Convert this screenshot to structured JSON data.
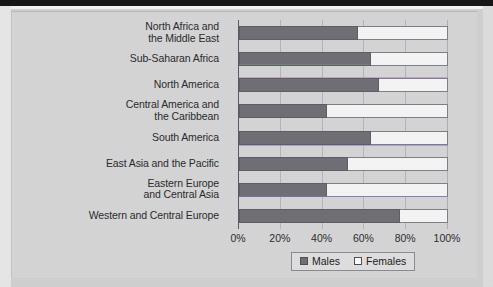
{
  "figure": {
    "background_color": "#d4d4d6",
    "page_background_color": "#cfcfcf"
  },
  "legend": {
    "position": "bottom-center",
    "items": [
      {
        "label": "Males",
        "swatch": "filled-dark-gray",
        "color": "#6e6e74"
      },
      {
        "label": "Females",
        "swatch": "empty-white",
        "color": "#fbfbfb"
      }
    ]
  },
  "axis": {
    "ticks": [
      "0%",
      "20%",
      "40%",
      "60%",
      "80%",
      "100%"
    ],
    "tick_values": [
      0,
      20,
      40,
      60,
      80,
      100
    ]
  },
  "chart_data": {
    "type": "bar",
    "orientation": "horizontal",
    "stacked": true,
    "normalized_percent": true,
    "title": "",
    "subtitle": "",
    "xlabel": "",
    "ylabel": "",
    "xlim": [
      0,
      100
    ],
    "xticks": [
      0,
      20,
      40,
      60,
      80,
      100
    ],
    "xticklabels": [
      "0%",
      "20%",
      "40%",
      "60%",
      "80%",
      "100%"
    ],
    "grid": true,
    "grid_axis": "x",
    "legend_position": "bottom-center",
    "categories": [
      "North Africa and the Middle East",
      "Sub-Saharan Africa",
      "North America",
      "Central America and the Caribbean",
      "South America",
      "East Asia and the Pacific",
      "Eastern Europe and Central Asia",
      "Western and Central Europe"
    ],
    "category_lines": [
      [
        "North Africa and",
        "the Middle East"
      ],
      [
        "Sub-Saharan Africa",
        ""
      ],
      [
        "North America",
        ""
      ],
      [
        "Central America and",
        "the Caribbean"
      ],
      [
        "South America",
        ""
      ],
      [
        "East Asia and the Pacific",
        ""
      ],
      [
        "Eastern Europe",
        "and Central Asia"
      ],
      [
        "Western and Central Europe",
        ""
      ]
    ],
    "series": [
      {
        "name": "Males",
        "color": "#6e6e74",
        "values": [
          57,
          63,
          67,
          42,
          63,
          52,
          42,
          77
        ]
      },
      {
        "name": "Females",
        "color": "#fbfbfb",
        "values": [
          43,
          37,
          33,
          58,
          37,
          48,
          58,
          23
        ]
      }
    ]
  }
}
